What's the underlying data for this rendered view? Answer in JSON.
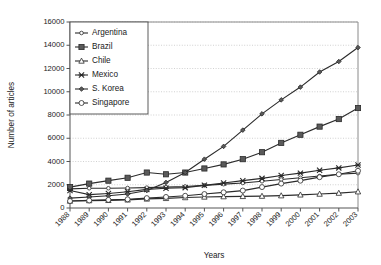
{
  "chart_data": {
    "type": "line",
    "title": "",
    "xlabel": "Years",
    "ylabel": "Number of articles",
    "categories": [
      "1988",
      "1989",
      "1990",
      "1991",
      "1992",
      "1993",
      "1994",
      "1995",
      "1996",
      "1997",
      "1998",
      "1999",
      "2000",
      "2001",
      "2002",
      "2003"
    ],
    "x": [
      1988,
      1989,
      1990,
      1991,
      1992,
      1993,
      1994,
      1995,
      1996,
      1997,
      1998,
      1999,
      2000,
      2001,
      2002,
      2003
    ],
    "ylim": [
      0,
      16000
    ],
    "ytick_labels": [
      "0",
      "2000",
      "4000",
      "6000",
      "8000",
      "10000",
      "12000",
      "14000",
      "16000"
    ],
    "ytick_values": [
      0,
      2000,
      4000,
      6000,
      8000,
      10000,
      12000,
      14000,
      16000
    ],
    "grid": "horizontal-dotted",
    "legend_position": "top-left-inside",
    "series": [
      {
        "name": "Argentina",
        "marker": "open-circle-small",
        "values": [
          1650,
          1700,
          1700,
          1720,
          1750,
          1800,
          1850,
          1950,
          2050,
          2150,
          2300,
          2450,
          2600,
          2750,
          2900,
          3000
        ]
      },
      {
        "name": "Brazil",
        "marker": "filled-square",
        "values": [
          1800,
          2100,
          2350,
          2600,
          3050,
          2900,
          3050,
          3400,
          3750,
          4200,
          4800,
          5600,
          6300,
          7000,
          7650,
          8600
        ]
      },
      {
        "name": "Chile",
        "marker": "open-triangle",
        "values": [
          600,
          640,
          660,
          700,
          780,
          830,
          900,
          950,
          980,
          1000,
          1020,
          1060,
          1130,
          1200,
          1280,
          1400
        ]
      },
      {
        "name": "Mexico",
        "marker": "cross-star",
        "values": [
          1500,
          1150,
          1250,
          1400,
          1600,
          1700,
          1750,
          1950,
          2150,
          2350,
          2550,
          2800,
          3000,
          3250,
          3450,
          3700
        ]
      },
      {
        "name": "S. Korea",
        "marker": "filled-diamond-small",
        "values": [
          850,
          950,
          1050,
          1200,
          1500,
          2200,
          3050,
          4200,
          5300,
          6700,
          8100,
          9300,
          10400,
          11700,
          12600,
          13800
        ]
      },
      {
        "name": "Singapore",
        "marker": "open-circle",
        "values": [
          600,
          650,
          700,
          750,
          850,
          950,
          1050,
          1200,
          1350,
          1500,
          1800,
          2100,
          2350,
          2650,
          2900,
          3200
        ]
      }
    ]
  },
  "legend": {
    "items": [
      {
        "label": "Argentina"
      },
      {
        "label": "Brazil"
      },
      {
        "label": "Chile"
      },
      {
        "label": "Mexico"
      },
      {
        "label": "S. Korea"
      },
      {
        "label": "Singapore"
      }
    ]
  },
  "axes": {
    "y_title": "Number of articles",
    "x_title": "Years"
  },
  "colors": {
    "line": "#2b2b2b",
    "marker_fill": "#5a5a5a",
    "grid": "#bdbdbd",
    "axis": "#555555",
    "background": "#ffffff"
  }
}
